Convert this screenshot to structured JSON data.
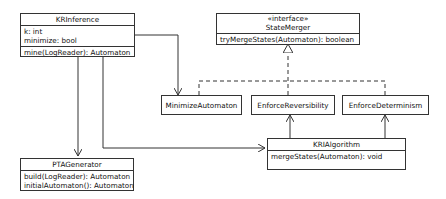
{
  "diagram": {
    "type": "UML class diagram",
    "classes": {
      "kr_inference": {
        "name": "KRInference",
        "attributes": [
          "k: int",
          "minimize: bool"
        ],
        "methods": [
          "mine(LogReader): Automaton"
        ]
      },
      "state_merger": {
        "stereotype": "«interface»",
        "name": "StateMerger",
        "methods": [
          "tryMergeStates(Automaton): boolean"
        ]
      },
      "minimize_automaton": {
        "name": "MinimizeAutomaton"
      },
      "enforce_reversibility": {
        "name": "EnforceReversibility"
      },
      "enforce_determinism": {
        "name": "EnforceDeterminism"
      },
      "kri_algorithm": {
        "name": "KRIAlgorithm",
        "methods": [
          "mergeStates(Automaton): void"
        ]
      },
      "pta_generator": {
        "name": "PTAGenerator",
        "methods": [
          "build(LogReader): Automaton",
          "initialAutomaton(): Automaton"
        ]
      }
    },
    "relationships": [
      {
        "from": "KRInference",
        "to": "MinimizeAutomaton",
        "kind": "association"
      },
      {
        "from": "KRInference",
        "to": "KRIAlgorithm",
        "kind": "association"
      },
      {
        "from": "KRInference",
        "to": "PTAGenerator",
        "kind": "association"
      },
      {
        "from": "MinimizeAutomaton",
        "to": "StateMerger",
        "kind": "realization"
      },
      {
        "from": "EnforceReversibility",
        "to": "StateMerger",
        "kind": "realization"
      },
      {
        "from": "EnforceDeterminism",
        "to": "StateMerger",
        "kind": "realization"
      },
      {
        "from": "KRIAlgorithm",
        "to": "EnforceReversibility",
        "kind": "association"
      },
      {
        "from": "KRIAlgorithm",
        "to": "EnforceDeterminism",
        "kind": "association"
      }
    ]
  }
}
